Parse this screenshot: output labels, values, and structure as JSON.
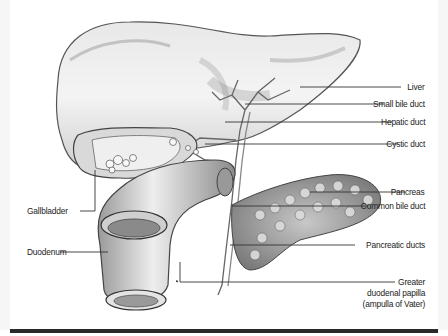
{
  "figure": {
    "labels": {
      "liver": "Liver",
      "small_bile_duct": "Small bile duct",
      "hepatic_duct": "Hepatic duct",
      "cystic_duct": "Cystic duct",
      "pancreas": "Pancreas",
      "common_bile_duct": "Common bile duct",
      "pancreatic_ducts": "Pancreatic ducts",
      "greater_papilla_line1": "Greater",
      "greater_papilla_line2": "duodenal papilla",
      "greater_papilla_line3": "(ampulla of Vater)",
      "gallbladder": "Gallbladder",
      "duodenum": "Duodenum"
    },
    "colors": {
      "background": "#ffffff",
      "ink": "#222222",
      "leader_line": "#333333",
      "bottom_rule": "#2a2a2a"
    }
  }
}
